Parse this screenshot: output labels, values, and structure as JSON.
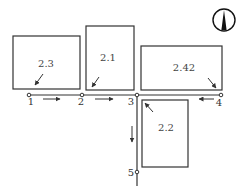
{
  "diagram": {
    "title": "",
    "colors": {
      "line": "#333333",
      "background": "#ffffff",
      "north_fill": "#111111"
    },
    "north_arrow": {
      "icon": "north-arrow-icon",
      "cx": 224,
      "cy": 20,
      "r": 11
    },
    "plots": [
      {
        "id": "2.3",
        "label": "2.3",
        "x": 13,
        "y": 36,
        "w": 67,
        "h": 53,
        "lx": 46,
        "ly": 67,
        "arrow": {
          "x1": 43,
          "y1": 74,
          "x2": 35,
          "y2": 85
        }
      },
      {
        "id": "2.1",
        "label": "2.1",
        "x": 86,
        "y": 26,
        "w": 48,
        "h": 64,
        "lx": 108,
        "ly": 61,
        "arrow": {
          "x1": 99,
          "y1": 77,
          "x2": 92,
          "y2": 87
        }
      },
      {
        "id": "2.42",
        "label": "2.42",
        "x": 141,
        "y": 46,
        "w": 81,
        "h": 44,
        "lx": 184,
        "ly": 71,
        "arrow": {
          "x1": 208,
          "y1": 78,
          "x2": 216,
          "y2": 88
        }
      },
      {
        "id": "2.2",
        "label": "2.2",
        "x": 142,
        "y": 100,
        "w": 46,
        "h": 67,
        "lx": 166,
        "ly": 131,
        "arrow": {
          "x1": 153,
          "y1": 112,
          "x2": 145,
          "y2": 103
        }
      }
    ],
    "road": {
      "horizontal": {
        "x1": 29,
        "x2": 221,
        "y": 95
      },
      "vertical": {
        "x": 137,
        "y1": 95,
        "y2": 186
      }
    },
    "nodes": [
      {
        "id": "1",
        "label": "1",
        "x": 29,
        "y": 95,
        "lx": 31,
        "ly": 105
      },
      {
        "id": "2",
        "label": "2",
        "x": 82,
        "y": 95,
        "lx": 81,
        "ly": 105
      },
      {
        "id": "3",
        "label": "3",
        "x": 137,
        "y": 95,
        "lx": 131,
        "ly": 105
      },
      {
        "id": "4",
        "label": "4",
        "x": 221,
        "y": 95,
        "lx": 219,
        "ly": 106
      },
      {
        "id": "5",
        "label": "5",
        "x": 137,
        "y": 172,
        "lx": 131,
        "ly": 176
      }
    ],
    "flow_arrows": [
      {
        "from": "1",
        "to": "2",
        "x1": 43,
        "y1": 99,
        "x2": 60,
        "y2": 99,
        "direction": "right"
      },
      {
        "from": "2",
        "to": "3",
        "x1": 95,
        "y1": 99,
        "x2": 113,
        "y2": 99,
        "direction": "right"
      },
      {
        "from": "4",
        "to": "3",
        "x1": 214,
        "y1": 99,
        "x2": 199,
        "y2": 99,
        "direction": "left"
      },
      {
        "from": "3",
        "to": "5",
        "x1": 132,
        "y1": 126,
        "x2": 132,
        "y2": 142,
        "direction": "down"
      }
    ]
  }
}
